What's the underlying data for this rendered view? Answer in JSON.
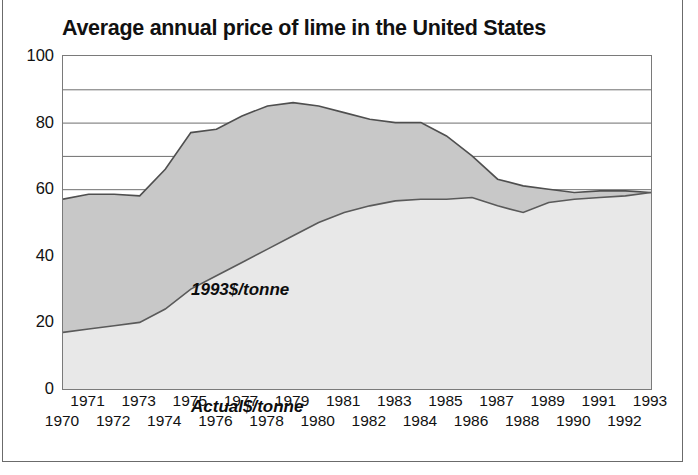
{
  "chart_data": {
    "type": "area",
    "title": "Average annual price of lime in the United States",
    "xlabel": "",
    "ylabel": "",
    "ylim": [
      0,
      100
    ],
    "yticks": [
      0,
      20,
      40,
      60,
      80,
      100
    ],
    "ytick_labels": [
      "0",
      "20",
      "40",
      "60",
      "80",
      "100"
    ],
    "gridlines": [
      10,
      20,
      30,
      40,
      50,
      60,
      70,
      80,
      90,
      100
    ],
    "grid": true,
    "legend_position": "inline-annotations",
    "x": [
      1970,
      1971,
      1972,
      1973,
      1974,
      1975,
      1976,
      1977,
      1978,
      1979,
      1980,
      1981,
      1982,
      1983,
      1984,
      1985,
      1986,
      1987,
      1988,
      1989,
      1990,
      1991,
      1992,
      1993
    ],
    "xtick_labels_odd": [
      "1971",
      "1973",
      "1975",
      "1977",
      "1979",
      "1981",
      "1983",
      "1985",
      "1987",
      "1989",
      "1991",
      "1993"
    ],
    "xtick_labels_even": [
      "1970",
      "1972",
      "1974",
      "1976",
      "1978",
      "1980",
      "1982",
      "1984",
      "1986",
      "1988",
      "1990",
      "1992"
    ],
    "series": [
      {
        "name": "1993$/tonne",
        "annotation": "1993$/tonne",
        "values": [
          57,
          58.5,
          58.5,
          58,
          66,
          77,
          78,
          82,
          85,
          86,
          85,
          83,
          81,
          80,
          80,
          76,
          70,
          63,
          61,
          60,
          59,
          59.5,
          59.5,
          59
        ]
      },
      {
        "name": "Actual$/tonne",
        "annotation": "Actual$/tonne",
        "values": [
          17,
          18,
          19,
          20,
          24,
          30,
          34,
          38,
          42,
          46,
          50,
          53,
          55,
          56.5,
          57,
          57,
          57.5,
          55,
          53,
          56,
          57,
          57.5,
          58,
          59
        ]
      }
    ],
    "colors": {
      "real_fill": "#c8c8c8",
      "nominal_fill": "#e6e6e6",
      "line": "#555555",
      "grid": "#6e6e6e",
      "text": "#111111"
    }
  }
}
